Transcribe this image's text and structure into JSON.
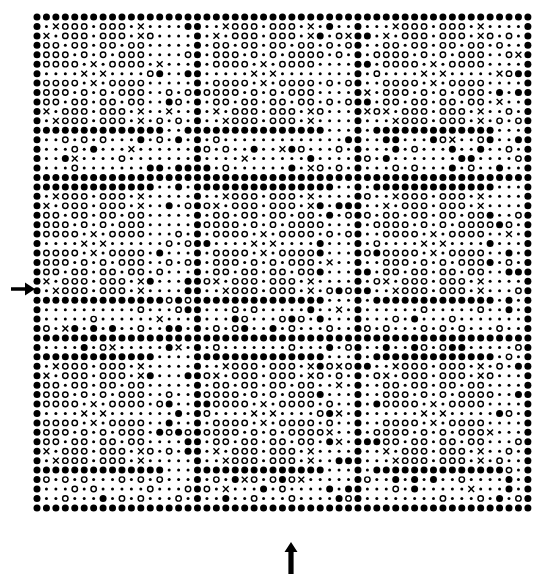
{
  "figure": {
    "kind": "2d-barcode-symbol-grid",
    "background_color": "#ffffff",
    "ink_color": "#000000"
  },
  "grid": {
    "columns": 53,
    "rows": 53,
    "origin_x": 37,
    "origin_y": 17,
    "module_pitch": 9.44,
    "macro_blocks_x": 3,
    "macro_blocks_y": 3,
    "macro_block_modules": 17
  },
  "symbols": {
    "legend": [
      {
        "key": "filled",
        "glyph": "●",
        "name": "filled-circle-module",
        "radius": 3.5,
        "style": "solid",
        "meaning": "dark module"
      },
      {
        "key": "open",
        "glyph": "○",
        "name": "open-circle-module",
        "radius": 3.3,
        "style": "ring",
        "meaning": "light module type A"
      },
      {
        "key": "cross",
        "glyph": "×",
        "name": "cross-module",
        "radius": 3.4,
        "style": "cross",
        "meaning": "light module type B"
      },
      {
        "key": "dot",
        "glyph": "·",
        "name": "small-dot-module",
        "radius": 1.5,
        "style": "solid",
        "meaning": "background / unset module"
      }
    ],
    "codes": {
      "filled": 0,
      "open": 1,
      "cross": 2,
      "dot": 3
    }
  },
  "finder_pattern": {
    "name": "corner-finder",
    "size_modules": 11,
    "rows": [
      "00000000000",
      "03213330",
      "02033302",
      "01103310",
      "01103310",
      "0111231110",
      "03332223330",
      "0111231110",
      "01103310",
      "02033302",
      "03213330",
      "00000000000"
    ],
    "template": [
      "00000000000",
      "03213331230",
      "02033303320",
      "01103310330",
      "01110233110",
      "03332332330",
      "01110233110",
      "01103310330",
      "02033303320",
      "03213331230",
      "00000000000"
    ]
  },
  "block_pattern": {
    "name": "finder-block-11x11",
    "rows": [
      "ffffffffffb",
      "fdxoood oooxd",
      "fxdooodooodxd",
      "foodoodoodood",
      "fooodododoood",
      "foooodxdooood",
      "fddddxdxddddd",
      "fooooxdooood",
      "fooodododoood",
      "foodoodoodood",
      "fxdooodooodxd",
      "fdxoooddoooxd",
      "fffffffffffff"
    ]
  },
  "macro_layout": {
    "note": "3 x 3 arrangement of data regions separated by solid timing lines",
    "separator_rows": [
      0,
      17,
      34,
      52
    ],
    "separator_cols": [
      0,
      17,
      34,
      52
    ],
    "finder_blocks": [
      {
        "col": 0,
        "row": 0,
        "name": "finder-top-left"
      },
      {
        "col": 36,
        "row": 0,
        "name": "finder-top-right"
      },
      {
        "col": 18,
        "row": 0,
        "name": "finder-top-center"
      },
      {
        "col": 0,
        "row": 18,
        "name": "finder-mid-left"
      },
      {
        "col": 18,
        "row": 18,
        "name": "finder-mid-center"
      },
      {
        "col": 36,
        "row": 18,
        "name": "finder-mid-right"
      },
      {
        "col": 0,
        "row": 36,
        "name": "finder-bottom-left"
      },
      {
        "col": 18,
        "row": 36,
        "name": "finder-bottom-center"
      },
      {
        "col": 36,
        "row": 36,
        "name": "finder-bottom-right"
      }
    ]
  },
  "data_fill": {
    "method": "deterministic-lcg",
    "seed": 20250417,
    "distribution": {
      "dot": 0.55,
      "open": 0.3,
      "filled": 0.12,
      "cross": 0.03
    },
    "note": "Interior data regions are pseudo-random module values reproducing the printed texture"
  },
  "annotations": {
    "left_arrow": {
      "name": "left-row-indicator-arrow",
      "direction": "right",
      "points_to_row": 28,
      "x": 11,
      "y": 281,
      "width": 24,
      "height": 16,
      "label": ""
    },
    "bottom_arrow": {
      "name": "bottom-column-indicator-arrow",
      "direction": "up",
      "points_to_column": 26,
      "x": 284,
      "y": 542,
      "width": 14,
      "height": 32,
      "label": ""
    }
  }
}
